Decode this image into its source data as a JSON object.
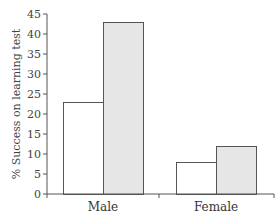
{
  "chart_data": {
    "type": "bar",
    "title": "",
    "xlabel": "",
    "ylabel": "% Success on learning test",
    "categories": [
      "Male",
      "Female"
    ],
    "series": [
      {
        "name": "Condition A (white)",
        "color": "#ffffff",
        "values": [
          23,
          8
        ]
      },
      {
        "name": "Condition B (gray)",
        "color": "#e6e6e6",
        "values": [
          43,
          12
        ]
      }
    ],
    "ylim": [
      0,
      45
    ],
    "yticks": [
      0,
      5,
      10,
      15,
      20,
      25,
      30,
      35,
      40,
      45
    ],
    "grid": false,
    "legend": "none"
  },
  "colors": {
    "axis": "#555555",
    "bar_outline": "#555555",
    "bar_white": "#ffffff",
    "bar_gray": "#e6e6e6"
  }
}
